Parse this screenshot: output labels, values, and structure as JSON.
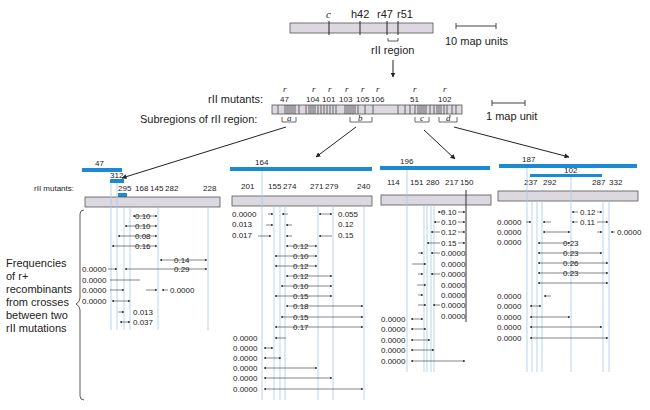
{
  "top_map": {
    "markers": [
      "c",
      "h42",
      "r47",
      "r51"
    ],
    "region_label": "rII region",
    "scale_label": "10 map units"
  },
  "rII_map": {
    "mutants_label": "rII mutants:",
    "mutants": [
      "47",
      "104",
      "101",
      "103",
      "105",
      "106",
      "51",
      "102"
    ],
    "subregions_label": "Subregions of rII region:",
    "subregions": [
      "a",
      "b",
      "c",
      "d"
    ],
    "scale_label": "1 map unit"
  },
  "side_label": {
    "lines": [
      "Frequencies",
      "of r+",
      "recombinants",
      "from crosses",
      "between two",
      "rII mutations"
    ]
  },
  "panels": [
    {
      "subregion": "a",
      "deletions": [
        "47",
        "312",
        ""
      ],
      "mutants_label": "rII mutants:",
      "mutants": [
        "295",
        "168",
        "145",
        "282",
        "228"
      ],
      "right_values": [
        "0.10",
        "0.10",
        "0.08",
        "0.16",
        "0.14",
        "0.29",
        "0.0000",
        "0.013",
        "0.037"
      ],
      "left_values": [
        "0.0000",
        "0.0000",
        "0.0000",
        "0.0000"
      ]
    },
    {
      "subregion": "b",
      "deletions": [
        "164"
      ],
      "mutants": [
        "201",
        "155",
        "274",
        "271",
        "279",
        "240"
      ],
      "left_values": [
        "0.0000",
        "0.013",
        "0.017"
      ],
      "right_values": [
        "0.055",
        "0.12",
        "0.15"
      ],
      "center_values": [
        "0.12",
        "0.10",
        "0.12",
        "0.12",
        "0.10",
        "0.15",
        "0.18",
        "0.15",
        "0.17"
      ],
      "bottom_values": [
        "0.0000",
        "0.0000",
        "0.0000",
        "0.0000",
        "0.0000",
        "0.0000"
      ]
    },
    {
      "subregion": "c",
      "deletions": [
        "196"
      ],
      "mutants": [
        "114",
        "151",
        "280",
        "217",
        "150"
      ],
      "center_values": [
        "0.10",
        "0.10",
        "0.12",
        "0.15",
        "0.0000",
        "0.0000",
        "0.0000",
        "0.0000",
        "0.0000",
        "0.0000",
        "0.0000"
      ],
      "bottom_values": [
        "0.0000",
        "0.0000",
        "0.0000",
        "0.0000",
        "0.0000"
      ]
    },
    {
      "subregion": "d",
      "deletions": [
        "187",
        "102"
      ],
      "mutants": [
        "237",
        "292",
        "287",
        "332"
      ],
      "center_values": [
        "0.12",
        "0.11",
        "0.23",
        "0.23",
        "0.26",
        "0.23"
      ],
      "left_values": [
        "0.0000",
        "0.0000",
        "0.0000"
      ],
      "right_values": [
        "0.0000"
      ],
      "bottom_values": [
        "0.0000",
        "0.0000",
        "0.0000",
        "0.0000",
        "0.0000"
      ]
    }
  ],
  "colors": {
    "deletion_bar": "#1a8ad4",
    "chromosome_fill": "#dcd8e0",
    "guide_line": "#a9c9e4"
  }
}
